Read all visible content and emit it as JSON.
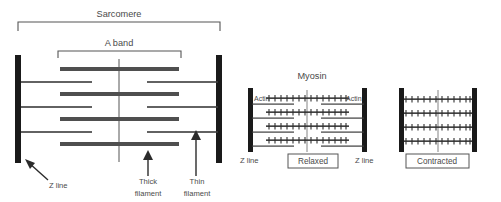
{
  "figure": {
    "title_labels": {
      "sarcomere": "Sarcomere",
      "a_band": "A band",
      "myosin": "Myosin"
    },
    "left_diagram": {
      "name": "sarcomere-overview",
      "brackets": [
        {
          "id": "sarcomere-bracket",
          "label": "Sarcomere",
          "x1": 18,
          "x2": 220,
          "y": 22,
          "depth": 9
        },
        {
          "id": "a-band-bracket",
          "label": "A band",
          "x1": 58,
          "x2": 181,
          "y": 51,
          "depth": 7
        }
      ],
      "z_lines": [
        {
          "id": "z-line-left",
          "x": 18,
          "y1": 55,
          "y2": 163,
          "width": 6
        },
        {
          "id": "z-line-right",
          "x": 219,
          "y1": 55,
          "y2": 163,
          "width": 6
        }
      ],
      "m_line": {
        "id": "m-line",
        "x": 119,
        "y1": 59,
        "y2": 162
      },
      "thick_filaments": [
        {
          "y": 70,
          "x1": 60,
          "x2": 179
        },
        {
          "y": 95,
          "x1": 60,
          "x2": 179
        },
        {
          "y": 120,
          "x1": 60,
          "x2": 179
        },
        {
          "y": 145,
          "x1": 60,
          "x2": 179
        }
      ],
      "thin_filaments": [
        {
          "y": 82,
          "x1": 21,
          "x2": 92
        },
        {
          "y": 82,
          "x1": 146,
          "x2": 219
        },
        {
          "y": 107,
          "x1": 21,
          "x2": 92
        },
        {
          "y": 107,
          "x1": 146,
          "x2": 219
        },
        {
          "y": 132,
          "x1": 21,
          "x2": 92
        },
        {
          "y": 132,
          "x1": 146,
          "x2": 219
        }
      ],
      "callouts": [
        {
          "id": "z-line-callout",
          "label": "Z line",
          "text_x": 50,
          "text_y": 186,
          "arrow": {
            "x1": 49,
            "y1": 180,
            "x2": 26,
            "y2": 160
          }
        },
        {
          "id": "thick-filament-callout",
          "label_line1": "Thick",
          "label_line2": "filament",
          "text_x": 148,
          "text_y": 182,
          "arrow": {
            "x1": 148,
            "y1": 176,
            "x2": 148,
            "y2": 152
          }
        },
        {
          "id": "thin-filament-callout",
          "label_line1": "Thin",
          "label_line2": "filament",
          "text_x": 196,
          "text_y": 182,
          "arrow": {
            "x1": 196,
            "y1": 176,
            "x2": 196,
            "y2": 129
          }
        }
      ]
    },
    "relaxed_diagram": {
      "name": "relaxed-sarcomere",
      "title": "Myosin",
      "title_x": 312,
      "title_y": 78,
      "state_label": "Relaxed",
      "actin_label_left": "Actin",
      "actin_label_right": "Actin",
      "z_line_label_left": "Z line",
      "z_line_label_right": "Z line",
      "z_lines": [
        {
          "id": "relaxed-z-line-left",
          "x": 250,
          "y1": 88,
          "y2": 152,
          "width": 5
        },
        {
          "id": "relaxed-z-line-right",
          "x": 364,
          "y1": 88,
          "y2": 152,
          "width": 5
        }
      ],
      "m_line": {
        "x": 307,
        "y1": 90,
        "y2": 152
      },
      "myosin_rows": [
        {
          "y": 98,
          "x1": 265,
          "x2": 349
        },
        {
          "y": 112,
          "x1": 267,
          "x2": 347
        },
        {
          "y": 126,
          "x1": 267,
          "x2": 347
        },
        {
          "y": 140,
          "x1": 267,
          "x2": 347
        }
      ],
      "actin_rows": [
        {
          "y": 104,
          "x1": 252,
          "x2": 293
        },
        {
          "y": 104,
          "x1": 322,
          "x2": 364
        },
        {
          "y": 118,
          "x1": 252,
          "x2": 293
        },
        {
          "y": 118,
          "x1": 322,
          "x2": 364
        },
        {
          "y": 132,
          "x1": 252,
          "x2": 293
        },
        {
          "y": 132,
          "x1": 322,
          "x2": 364
        },
        {
          "y": 146,
          "x1": 252,
          "x2": 293
        },
        {
          "y": 146,
          "x1": 322,
          "x2": 364
        }
      ],
      "crossbridge_spacing": 6,
      "crossbridge_height": 4
    },
    "contracted_diagram": {
      "name": "contracted-sarcomere",
      "state_label": "Contracted",
      "z_lines": [
        {
          "id": "contracted-z-line-left",
          "x": 401,
          "y1": 88,
          "y2": 152,
          "width": 5
        },
        {
          "id": "contracted-z-line-right",
          "x": 474,
          "y1": 88,
          "y2": 152,
          "width": 5
        }
      ],
      "m_line": {
        "x": 438,
        "y1": 90,
        "y2": 152
      },
      "myosin_rows": [
        {
          "y": 99,
          "x1": 404,
          "x2": 472
        },
        {
          "y": 113,
          "x1": 404,
          "x2": 472
        },
        {
          "y": 127,
          "x1": 404,
          "x2": 472
        },
        {
          "y": 141,
          "x1": 404,
          "x2": 472
        }
      ],
      "crossbridge_spacing": 6,
      "crossbridge_height": 4
    },
    "colors": {
      "z_line": "#1a1a1a",
      "thick_filament": "#4f4f4f",
      "thin_filament": "#3c3c3c",
      "bracket": "#555555",
      "text": "#4a4a4a",
      "box_border": "#555555",
      "background": "#ffffff",
      "myosin": "#3a3a3a"
    }
  }
}
